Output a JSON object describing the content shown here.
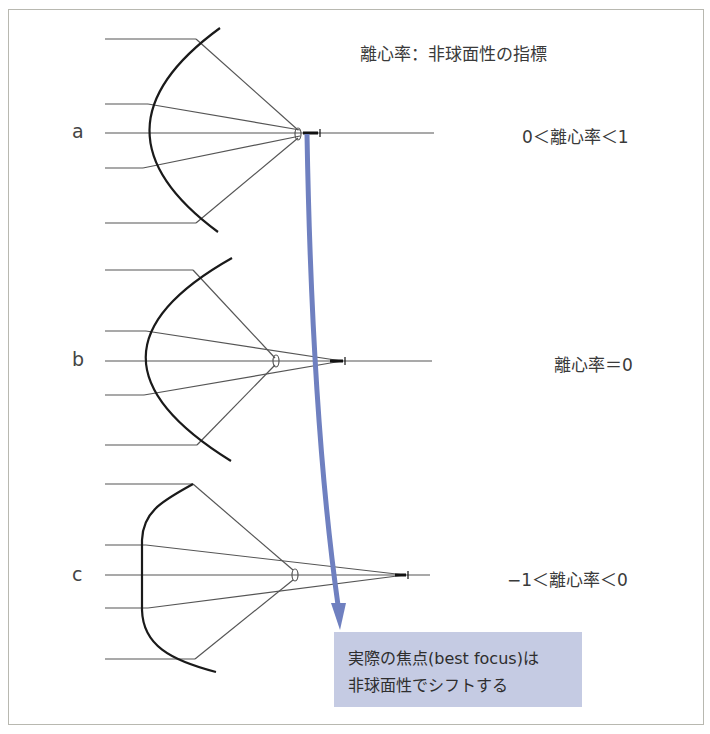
{
  "header": {
    "definition": "離心率：非球面性の指標"
  },
  "rows": [
    {
      "letter": "a",
      "condition": "0＜離心率＜1"
    },
    {
      "letter": "b",
      "condition": "離心率＝0"
    },
    {
      "letter": "c",
      "condition": "−1＜離心率＜0"
    }
  ],
  "note": {
    "line1": "実際の焦点(best focus)は",
    "line2": "非球面性でシフトする"
  },
  "colors": {
    "arrow": "#6f80c0",
    "note_bg": "#c5cbe3",
    "mirror": "#1a1a1a",
    "rays": "#555555",
    "frame": "#b8b8b0"
  }
}
